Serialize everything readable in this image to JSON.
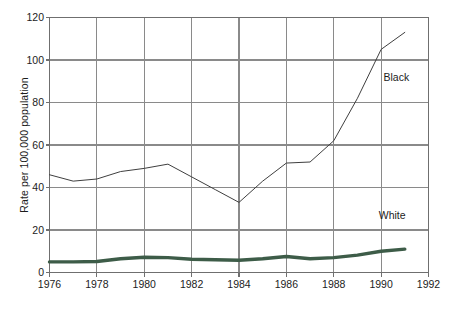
{
  "chart_data": {
    "type": "line",
    "title": "",
    "subtitle": "",
    "xlabel": "",
    "ylabel": "Rate per 100,000 population",
    "xlim": [
      1976,
      1992
    ],
    "ylim": [
      0,
      120
    ],
    "ytick_labels": [
      "0",
      "20",
      "40",
      "60",
      "80",
      "100",
      "120"
    ],
    "ytick_values": [
      0,
      20,
      40,
      60,
      80,
      100,
      120
    ],
    "xtick_labels": [
      "1976",
      "1978",
      "1980",
      "1982",
      "1984",
      "1986",
      "1988",
      "1990",
      "1992"
    ],
    "xtick_values": [
      1976,
      1978,
      1980,
      1982,
      1984,
      1986,
      1988,
      1990,
      1992
    ],
    "grid": true,
    "grid_color": "#8a8a8a",
    "legend_position": "inline-annotations",
    "x": [
      1976,
      1977,
      1978,
      1979,
      1980,
      1981,
      1982,
      1983,
      1984,
      1985,
      1986,
      1987,
      1988,
      1989,
      1990,
      1991
    ],
    "series": [
      {
        "name": "Black",
        "color": "#3f3f3f",
        "width": 1,
        "values": [
          46,
          43,
          44,
          47.5,
          49,
          51,
          45,
          39,
          33,
          43,
          51.5,
          52,
          62,
          82,
          105,
          113
        ]
      },
      {
        "name": "White",
        "color": "#3d5c48",
        "width": 3.4,
        "values": [
          5,
          5,
          5.2,
          6.5,
          7.2,
          7,
          6.2,
          6,
          5.8,
          6.5,
          7.5,
          6.5,
          7,
          8.2,
          10,
          11
        ]
      }
    ],
    "annotations": [
      {
        "text": "Black",
        "x": 1990.1,
        "y": 92
      },
      {
        "text": "White",
        "x": 1989.9,
        "y": 27
      }
    ]
  },
  "axes": {
    "frame_color": "#6f6f6f"
  }
}
